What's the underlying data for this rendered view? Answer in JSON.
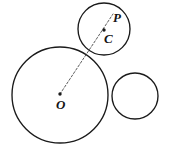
{
  "figure": {
    "background_color": "#ffffff",
    "stroke_color": "#1a1a1a",
    "dash_color": "#4a4a4a",
    "width": 171,
    "height": 149,
    "labels": {
      "P": "P",
      "C": "C",
      "O": "O"
    },
    "circles": [
      {
        "name": "large-circle-O",
        "center_label": "O",
        "cx": 60,
        "cy": 95,
        "r": 48
      },
      {
        "name": "top-circle-C",
        "center_label": "C",
        "cx": 104,
        "cy": 29,
        "r": 26
      },
      {
        "name": "right-circle",
        "center_label": "",
        "cx": 135,
        "cy": 96,
        "r": 23
      }
    ],
    "points": [
      {
        "name": "O",
        "x": 60,
        "y": 95
      },
      {
        "name": "C",
        "x": 104,
        "y": 29
      },
      {
        "name": "P",
        "x": 112,
        "y": 17
      }
    ],
    "ray": {
      "name": "ray-O-to-P",
      "from": "O",
      "through": "C",
      "to": "P",
      "style": "dashed",
      "x1": 60,
      "y1": 94,
      "x2": 113,
      "y2": 14
    }
  }
}
